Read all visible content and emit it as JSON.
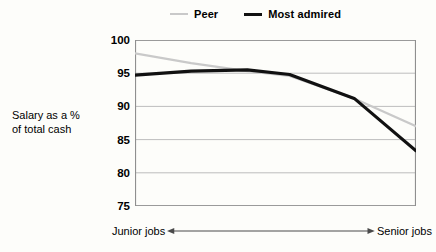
{
  "chart_data": {
    "type": "line",
    "title": "",
    "xlabel": "",
    "ylabel": "Salary as a % of total cash",
    "ylim": [
      75,
      100
    ],
    "ytick_labels": [
      "100",
      "95",
      "90",
      "85",
      "80",
      "75"
    ],
    "ytick_values": [
      100,
      95,
      90,
      85,
      80,
      75
    ],
    "grid": true,
    "legend_position": "top-center",
    "x_axis_note": "Job level axis running from junior jobs on the left to senior jobs on the right",
    "x_left_label": "Junior jobs",
    "x_right_label": "Senior jobs",
    "x": [
      0,
      0.2,
      0.4,
      0.55,
      0.78,
      1.0
    ],
    "series": [
      {
        "name": "Peer",
        "color": "#c9c9c9",
        "width": 2,
        "values": [
          98.0,
          96.5,
          95.3,
          94.6,
          91.2,
          87.0
        ]
      },
      {
        "name": "Most admired",
        "color": "#111111",
        "width": 3,
        "values": [
          94.7,
          95.3,
          95.5,
          94.8,
          91.2,
          83.3
        ]
      }
    ]
  },
  "legend": {
    "entries": [
      {
        "label": "Peer",
        "swatch": "line-swatch-light"
      },
      {
        "label": "Most admired",
        "swatch": "line-swatch-dark"
      }
    ]
  },
  "axis": {
    "y_title_line1": "Salary as a %",
    "y_title_line2": "of total cash",
    "ticks": [
      "100",
      "95",
      "90",
      "85",
      "80",
      "75"
    ],
    "x_left": "Junior jobs",
    "x_right": "Senior jobs"
  },
  "colors": {
    "peer_line": "#c9c9c9",
    "admired_line": "#111111",
    "grid": "#b4b4b4",
    "axis": "#808080",
    "background": "#fdfdfa",
    "text": "#000000"
  }
}
